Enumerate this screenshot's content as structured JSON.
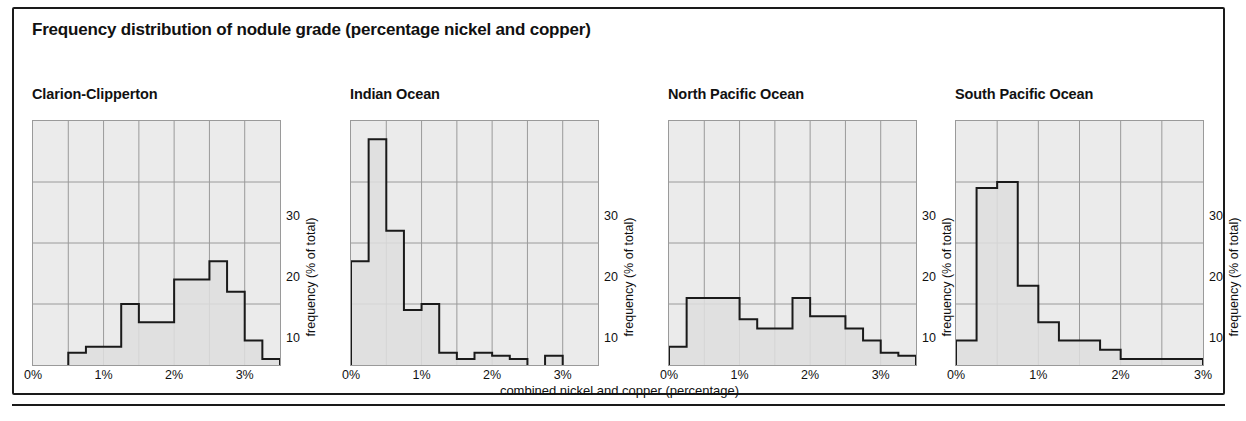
{
  "figure": {
    "title": "Frequency distribution of nodule grade (percentage nickel and copper)",
    "xaxis_caption": "combined nickel and copper (percentage)",
    "yaxis_title": "frequency (% of total)",
    "xtick_labels": [
      "0%",
      "1%",
      "2%",
      "3%"
    ],
    "ytick_labels": [
      "10",
      "20",
      "30"
    ],
    "colors": {
      "plot_background": "#ebebeb",
      "gridline": "#9a9a9a",
      "histogram_outline": "#1a1a1a",
      "histogram_fill": "#dedede",
      "frame": "#1a1a1a",
      "text": "#111111",
      "page_background": "#ffffff"
    }
  },
  "chart_data": [
    {
      "type": "bar",
      "title": "Clarion-Clipperton",
      "xlabel": "combined nickel and copper (percentage)",
      "ylabel": "frequency (% of total)",
      "xlim": [
        0,
        3.5
      ],
      "ylim": [
        0,
        40
      ],
      "xtick_values": [
        0,
        1,
        2,
        3
      ],
      "xtick_labels": [
        "0%",
        "1%",
        "2%",
        "3%"
      ],
      "ytick_values": [
        10,
        20,
        30
      ],
      "ytick_labels": [
        "10",
        "20",
        "30"
      ],
      "grid": true,
      "gridline_x_step": 0.5,
      "bin_width": 0.25,
      "bin_edges": [
        0.0,
        0.25,
        0.5,
        0.75,
        1.0,
        1.25,
        1.5,
        1.75,
        2.0,
        2.25,
        2.5,
        2.75,
        3.0,
        3.25,
        3.5
      ],
      "values": [
        0,
        0,
        2,
        3,
        3,
        10,
        7,
        7,
        14,
        14,
        17,
        12,
        4,
        1
      ]
    },
    {
      "type": "bar",
      "title": "Indian Ocean",
      "xlabel": "combined nickel and copper (percentage)",
      "ylabel": "frequency (% of total)",
      "xlim": [
        0,
        3.5
      ],
      "ylim": [
        0,
        40
      ],
      "xtick_values": [
        0,
        1,
        2,
        3
      ],
      "xtick_labels": [
        "0%",
        "1%",
        "2%",
        "3%"
      ],
      "ytick_values": [
        10,
        20,
        30
      ],
      "ytick_labels": [
        "10",
        "20",
        "30"
      ],
      "grid": true,
      "gridline_x_step": 0.5,
      "bin_width": 0.25,
      "bin_edges": [
        0.0,
        0.25,
        0.5,
        0.75,
        1.0,
        1.25,
        1.5,
        1.75,
        2.0,
        2.25,
        2.5,
        2.75,
        3.0,
        3.25,
        3.5
      ],
      "values": [
        17,
        37,
        22,
        9,
        10,
        2,
        1,
        2,
        1.5,
        1,
        0,
        1.5,
        0,
        0
      ]
    },
    {
      "type": "bar",
      "title": "North Pacific Ocean",
      "xlabel": "combined nickel and copper (percentage)",
      "ylabel": "frequency (% of total)",
      "xlim": [
        0,
        3.5
      ],
      "ylim": [
        0,
        40
      ],
      "xtick_values": [
        0,
        1,
        2,
        3
      ],
      "xtick_labels": [
        "0%",
        "1%",
        "2%",
        "3%"
      ],
      "ytick_values": [
        10,
        20,
        30
      ],
      "ytick_labels": [
        "10",
        "20",
        "30"
      ],
      "grid": true,
      "gridline_x_step": 0.5,
      "bin_width": 0.25,
      "bin_edges": [
        0.0,
        0.25,
        0.5,
        0.75,
        1.0,
        1.25,
        1.5,
        1.75,
        2.0,
        2.25,
        2.5,
        2.75,
        3.0,
        3.25,
        3.5
      ],
      "values": [
        3,
        11,
        11,
        11,
        7.5,
        6,
        6,
        11,
        8,
        8,
        6,
        4,
        2,
        1.5
      ]
    },
    {
      "type": "bar",
      "title": "South Pacific Ocean",
      "xlabel": "combined nickel and copper (percentage)",
      "ylabel": "frequency (% of total)",
      "xlim": [
        0,
        3.0
      ],
      "ylim": [
        0,
        40
      ],
      "xtick_values": [
        0,
        1,
        2,
        3
      ],
      "xtick_labels": [
        "0%",
        "1%",
        "2%",
        "3%"
      ],
      "ytick_values": [
        10,
        20,
        30
      ],
      "ytick_labels": [
        "10",
        "20",
        "30"
      ],
      "grid": true,
      "gridline_x_step": 0.5,
      "bin_width": 0.25,
      "bin_edges": [
        0.0,
        0.25,
        0.5,
        0.75,
        1.0,
        1.25,
        1.5,
        1.75,
        2.0,
        2.25,
        2.5,
        2.75,
        3.0
      ],
      "values": [
        4,
        29,
        30,
        13,
        7,
        4,
        4,
        2.5,
        1,
        1,
        1,
        1
      ]
    }
  ]
}
